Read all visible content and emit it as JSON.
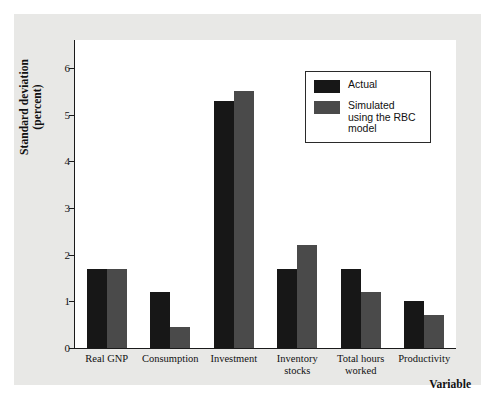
{
  "chart_data": {
    "type": "bar",
    "title": "",
    "xlabel": "Variable",
    "ylabel": "Standard deviation (percent)",
    "ylabel_line1": "Standard deviation",
    "ylabel_line2": "(percent)",
    "ylim": [
      0,
      6.6
    ],
    "yticks": [
      0,
      1,
      2,
      3,
      4,
      5,
      6
    ],
    "ytick_labels": [
      "0",
      "1",
      "2",
      "3",
      "4",
      "5",
      "6"
    ],
    "grid": false,
    "legend_position": "top-right",
    "categories": [
      "Real GNP",
      "Consumption",
      "Investment",
      "Inventory stocks",
      "Total hours worked",
      "Productivity"
    ],
    "category_lines": [
      [
        "Real GNP"
      ],
      [
        "Consumption"
      ],
      [
        "Investment"
      ],
      [
        "Inventory",
        "stocks"
      ],
      [
        "Total hours",
        "worked"
      ],
      [
        "Productivity"
      ]
    ],
    "series": [
      {
        "name": "Actual",
        "color": "#171717",
        "values": [
          1.7,
          1.2,
          5.3,
          1.7,
          1.7,
          1.0
        ]
      },
      {
        "name": "Simulated using the RBC model",
        "color": "#4a4a4a",
        "values": [
          1.7,
          0.45,
          5.5,
          2.2,
          1.2,
          0.7
        ]
      }
    ]
  },
  "legend": {
    "items": [
      {
        "label": "Actual",
        "color": "#171717"
      },
      {
        "label": "Simulated using the RBC model",
        "color": "#4a4a4a"
      }
    ]
  },
  "colors": {
    "actual": "#171717",
    "simulated": "#4a4a4a",
    "page_background": "#e8e8e6",
    "plot_background": "#ffffff",
    "axis": "#1a1a1a"
  }
}
